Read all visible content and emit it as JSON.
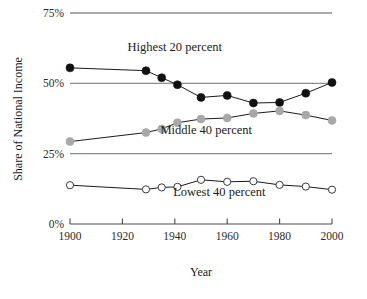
{
  "chart_data": {
    "type": "line",
    "title": "",
    "xlabel": "Year",
    "ylabel": "Share of National Income",
    "x": [
      1900,
      1929,
      1935,
      1941,
      1950,
      1960,
      1970,
      1980,
      1990,
      2000
    ],
    "xlim": [
      1900,
      2000
    ],
    "ylim": [
      0,
      75
    ],
    "xticks": [
      1900,
      1920,
      1940,
      1960,
      1980,
      2000
    ],
    "xticklabels": [
      "1900",
      "1920",
      "1940",
      "1960",
      "1980",
      "2000"
    ],
    "yticks": [
      0,
      25,
      50,
      75
    ],
    "yticklabels": [
      "0%",
      "25%",
      "50%",
      "75%"
    ],
    "grid": "horizontal gridlines at 25%, 50%, 75%",
    "legend": "inline labels on plot",
    "series": [
      {
        "name": "Highest 20 percent",
        "marker": "filled-circle",
        "marker_color": "#111111",
        "line_color": "#1a1a1a",
        "label_x": 1940,
        "label_y": 61.5,
        "values": [
          55.5,
          54.5,
          52.0,
          49.5,
          45.0,
          45.7,
          43.0,
          43.2,
          46.5,
          50.3
        ]
      },
      {
        "name": "Middle 40 percent",
        "marker": "filled-circle",
        "marker_color": "#a8a8a8",
        "line_color": "#1a1a1a",
        "label_x": 1952,
        "label_y": 32.0,
        "values": [
          29.3,
          32.5,
          33.8,
          36.0,
          37.3,
          37.7,
          39.3,
          40.2,
          38.7,
          36.8
        ]
      },
      {
        "name": "Lowest 40 percent",
        "marker": "open-circle",
        "marker_color": "#ffffff",
        "line_color": "#1a1a1a",
        "label_x": 1957,
        "label_y": 10.0,
        "values": [
          13.8,
          12.3,
          13.0,
          13.2,
          15.7,
          15.0,
          15.2,
          13.9,
          13.3,
          12.2
        ]
      }
    ],
    "colors": {
      "gridline": "#8c8c8c",
      "axis": "#4a4a4a",
      "text": "#1a1a1a",
      "highest_marker": "#111111",
      "middle_marker": "#a8a8a8",
      "lowest_marker": "#ffffff"
    }
  },
  "axes": {
    "y_title": "Share of National Income",
    "x_title": "Year",
    "y_tick_0": "0%",
    "y_tick_25": "25%",
    "y_tick_50": "50%",
    "y_tick_75": "75%",
    "x_tick_1900": "1900",
    "x_tick_1920": "1920",
    "x_tick_1940": "1940",
    "x_tick_1960": "1960",
    "x_tick_1980": "1980",
    "x_tick_2000": "2000"
  },
  "series_labels": {
    "highest": "Highest 20 percent",
    "middle": "Middle 40 percent",
    "lowest": "Lowest 40 percent"
  }
}
